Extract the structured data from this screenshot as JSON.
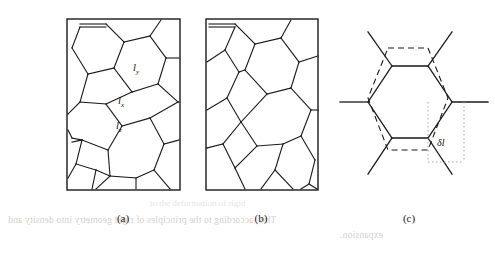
{
  "figure": {
    "type": "scientific-figure",
    "background_color": "#ffffff",
    "line_color": "#1a1a1a",
    "width": 495,
    "height": 258
  },
  "panels": [
    {
      "id": "a",
      "caption": "(a)",
      "kind": "honeycomb-lattice-bordered",
      "x": 66,
      "y": 18,
      "w": 114,
      "h": 172,
      "labels": [
        {
          "name": "l-y",
          "base": "l",
          "sub": "y",
          "x": 133,
          "y": 63
        },
        {
          "name": "l-x",
          "base": "l",
          "sub": "x",
          "x": 118,
          "y": 96
        },
        {
          "name": "l-z",
          "base": "l",
          "sub": "z",
          "x": 116,
          "y": 121
        }
      ]
    },
    {
      "id": "b",
      "caption": "(b)",
      "kind": "honeycomb-lattice-bordered",
      "x": 205,
      "y": 18,
      "w": 113,
      "h": 172,
      "labels": []
    },
    {
      "id": "c",
      "caption": "(c)",
      "kind": "single-hexagon-with-reference",
      "x": 345,
      "y": 22,
      "w": 130,
      "h": 155,
      "labels": [
        {
          "name": "delta-l",
          "base": "δl",
          "sub": "",
          "x": 440,
          "y": 143
        }
      ]
    }
  ],
  "captions": {
    "a": {
      "text": "(a)",
      "x": 104,
      "y": 214
    },
    "b": {
      "text": "(b)",
      "x": 242,
      "y": 214
    },
    "c": {
      "text": "(c)",
      "x": 390,
      "y": 214
    }
  },
  "ghost_text": {
    "line1": "This, according to the principles of rigid geometry into density and",
    "line1_x": 8,
    "line1_y": 221,
    "line2": "expansion.",
    "line2_x": 340,
    "line2_y": 236,
    "block_a": "to the deformation of rigid",
    "block_a_x": 200,
    "block_a_y": 205
  },
  "colors": {
    "stroke": "#1a1a1a",
    "dashed": "#1a1a1a",
    "dotted": "#9a9a9a",
    "ghost": "#cfcac4",
    "page": "#ffffff"
  }
}
